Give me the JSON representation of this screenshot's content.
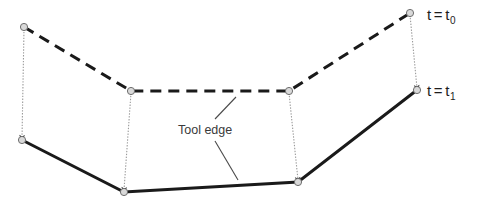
{
  "figure": {
    "width": 484,
    "height": 207,
    "background_color": "#ffffff"
  },
  "labels": {
    "t0": {
      "variable": "t",
      "equals": "=",
      "value": "t",
      "subscript": "0",
      "full_text": "t = t0"
    },
    "t1": {
      "variable": "t",
      "equals": "=",
      "value": "t",
      "subscript": "1",
      "full_text": "t = t1"
    },
    "tool_edge": "Tool edge"
  },
  "styles": {
    "dashed_edge_color": "#1a1a1a",
    "solid_edge_color": "#1a1a1a",
    "displacement_line_color": "#9a9a9a",
    "node_fill": "#d9d9d9",
    "node_stroke": "#6e6e6e",
    "leader_line_color": "#4a4a4a",
    "text_color": "#1d1d1d"
  },
  "geometry": {
    "tool_edge_t0": {
      "label": "t = t0",
      "line_style": "dashed",
      "stroke_width": 3,
      "points": [
        {
          "name": "left-end",
          "x": 24,
          "y": 27
        },
        {
          "name": "left-knee",
          "x": 131,
          "y": 91
        },
        {
          "name": "right-knee",
          "x": 289,
          "y": 91
        },
        {
          "name": "right-end",
          "x": 410,
          "y": 13
        }
      ]
    },
    "tool_edge_t1": {
      "label": "t = t1",
      "line_style": "solid",
      "stroke_width": 3,
      "points": [
        {
          "name": "left-end",
          "x": 22,
          "y": 140
        },
        {
          "name": "left-knee",
          "x": 124,
          "y": 192
        },
        {
          "name": "right-knee",
          "x": 298,
          "y": 182
        },
        {
          "name": "right-end",
          "x": 417,
          "y": 90
        }
      ]
    },
    "displacement_arrows": [
      {
        "name": "displacement-left-end",
        "x1": 24,
        "y1": 29,
        "x2": 22,
        "y2": 138
      },
      {
        "name": "displacement-left-knee",
        "x1": 131,
        "y1": 93,
        "x2": 124,
        "y2": 190
      },
      {
        "name": "displacement-right-knee",
        "x1": 289,
        "y1": 93,
        "x2": 298,
        "y2": 180
      },
      {
        "name": "displacement-right-end",
        "x1": 410,
        "y1": 15,
        "x2": 417,
        "y2": 88
      }
    ],
    "leader_lines": [
      {
        "name": "leader-to-dashed-edge",
        "x1": 215,
        "y1": 119,
        "x2": 236,
        "y2": 97
      },
      {
        "name": "leader-to-solid-edge",
        "x1": 215,
        "y1": 141,
        "x2": 238,
        "y2": 180
      }
    ],
    "nodes": [
      {
        "name": "node-t0-left-end",
        "x": 24,
        "y": 27,
        "r": 3.6,
        "shape": "circle"
      },
      {
        "name": "node-t0-left-knee",
        "x": 131,
        "y": 91,
        "r": 3.6,
        "shape": "circle"
      },
      {
        "name": "node-t0-right-knee",
        "x": 289,
        "y": 91,
        "r": 3.6,
        "shape": "circle"
      },
      {
        "name": "node-t0-right-end",
        "x": 410,
        "y": 13,
        "r": 3.6,
        "shape": "circle"
      },
      {
        "name": "node-t1-left-end",
        "x": 22,
        "y": 140,
        "r": 3.6,
        "shape": "circle"
      },
      {
        "name": "node-t1-left-knee",
        "x": 124,
        "y": 192,
        "r": 3.6,
        "shape": "circle"
      },
      {
        "name": "node-t1-right-knee",
        "x": 298,
        "y": 182,
        "r": 3.6,
        "shape": "circle"
      },
      {
        "name": "node-t1-right-end",
        "x": 417,
        "y": 90,
        "r": 3.6,
        "shape": "circle"
      }
    ]
  }
}
